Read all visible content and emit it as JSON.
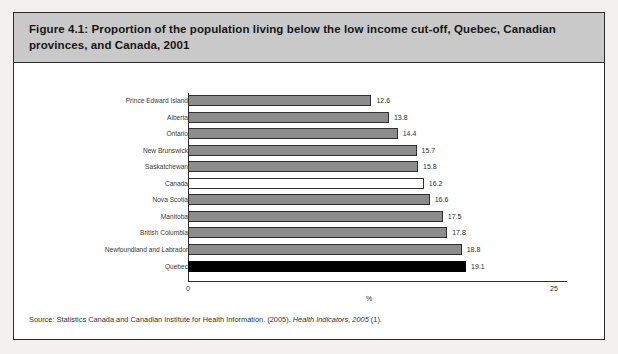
{
  "figure": {
    "title": "Figure 4.1: Proportion of the population living below the low income cut-off, Quebec, Canadian provinces, and Canada, 2001",
    "source_prefix": "Source: Statistics Canada and Canadian Institute for Health Information. (2005). ",
    "source_italic": "Health Indicators, 2005",
    "source_suffix": " (1)."
  },
  "colors": {
    "frame": "#2b2b2b",
    "title_band": "#c9c9c9",
    "bar_default": "#8c8c8c",
    "bar_highlight_country": "#ffffff",
    "bar_highlight_quebec": "#000000",
    "page_background": "#f2f1ef"
  },
  "chart_data": {
    "type": "bar",
    "orientation": "horizontal",
    "title": "Figure 4.1: Proportion of the population living below the low income cut-off, Quebec, Canadian provinces, and Canada, 2001",
    "xlabel": "%",
    "ylabel": "",
    "xlim": [
      0,
      25
    ],
    "xticks": [
      0,
      25
    ],
    "xtick_labels": [
      "0",
      "25"
    ],
    "grid": false,
    "legend": false,
    "categories": [
      "Prince Edward Island",
      "Alberta",
      "Ontario",
      "New Brunswick",
      "Saskatchewan",
      "Canada",
      "Nova Scotia",
      "Manitoba",
      "British Columbia",
      "Newfoundland and Labrador",
      "Quebec"
    ],
    "values": [
      12.6,
      13.8,
      14.4,
      15.7,
      15.8,
      16.2,
      16.6,
      17.5,
      17.8,
      18.8,
      19.1
    ],
    "value_labels": [
      "12.6",
      "13.8",
      "14.4",
      "15.7",
      "15.8",
      "16.2",
      "16.6",
      "17.5",
      "17.8",
      "18.8",
      "19.1"
    ],
    "bar_styles": [
      "gray",
      "gray",
      "gray",
      "gray",
      "gray",
      "white",
      "gray",
      "gray",
      "gray",
      "gray",
      "black"
    ]
  }
}
